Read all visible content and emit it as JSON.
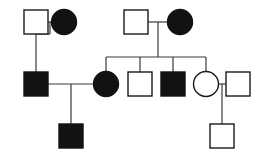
{
  "figure": {
    "kind": "pedigree-chart",
    "title": "",
    "background_color": "#ffffff",
    "stroke_color": "#3a3a3a",
    "symbol_outline_color": "#1a1a1a",
    "affected_fill_color": "#121212",
    "unaffected_fill_color": "#ffffff",
    "width": 260,
    "height": 157
  },
  "legend_meaning": {
    "square": "male",
    "circle": "female",
    "filled": "affected",
    "open": "unaffected"
  },
  "chart_data": {
    "type": "diagram",
    "diagram_type": "pedigree",
    "generations": 3,
    "individuals": [
      {
        "id": "I-1",
        "generation": 1,
        "sex": "male",
        "shape": "square",
        "status": "unaffected",
        "filled": false,
        "x": 36,
        "y": 22,
        "size": 24
      },
      {
        "id": "I-2",
        "generation": 1,
        "sex": "female",
        "shape": "circle",
        "status": "affected",
        "filled": true,
        "x": 64,
        "y": 22,
        "size": 24
      },
      {
        "id": "I-3",
        "generation": 1,
        "sex": "male",
        "shape": "square",
        "status": "unaffected",
        "filled": false,
        "x": 136,
        "y": 22,
        "size": 24
      },
      {
        "id": "I-4",
        "generation": 1,
        "sex": "female",
        "shape": "circle",
        "status": "affected",
        "filled": true,
        "x": 180,
        "y": 22,
        "size": 24
      },
      {
        "id": "II-1",
        "generation": 2,
        "sex": "male",
        "shape": "square",
        "status": "affected",
        "filled": true,
        "x": 36,
        "y": 84,
        "size": 24
      },
      {
        "id": "II-2",
        "generation": 2,
        "sex": "female",
        "shape": "circle",
        "status": "affected",
        "filled": true,
        "x": 106,
        "y": 84,
        "size": 24
      },
      {
        "id": "II-3",
        "generation": 2,
        "sex": "male",
        "shape": "square",
        "status": "unaffected",
        "filled": false,
        "x": 140,
        "y": 84,
        "size": 24
      },
      {
        "id": "II-4",
        "generation": 2,
        "sex": "male",
        "shape": "square",
        "status": "affected",
        "filled": true,
        "x": 173,
        "y": 84,
        "size": 24
      },
      {
        "id": "II-5",
        "generation": 2,
        "sex": "female",
        "shape": "circle",
        "status": "unaffected",
        "filled": false,
        "x": 206,
        "y": 84,
        "size": 24
      },
      {
        "id": "II-6",
        "generation": 2,
        "sex": "male",
        "shape": "square",
        "status": "unaffected",
        "filled": false,
        "x": 238,
        "y": 84,
        "size": 24
      },
      {
        "id": "III-1",
        "generation": 3,
        "sex": "male",
        "shape": "square",
        "status": "affected",
        "filled": true,
        "x": 71,
        "y": 136,
        "size": 24
      },
      {
        "id": "III-2",
        "generation": 3,
        "sex": "male",
        "shape": "square",
        "status": "unaffected",
        "filled": false,
        "x": 222,
        "y": 136,
        "size": 24
      }
    ],
    "matings": [
      {
        "id": "M1",
        "partners": [
          "I-1",
          "I-2"
        ],
        "children": [
          "II-1"
        ]
      },
      {
        "id": "M2",
        "partners": [
          "I-3",
          "I-4"
        ],
        "children": [
          "II-2",
          "II-3",
          "II-4",
          "II-5"
        ]
      },
      {
        "id": "M3",
        "partners": [
          "II-1",
          "II-2"
        ],
        "children": [
          "III-1"
        ]
      },
      {
        "id": "M4",
        "partners": [
          "II-5",
          "II-6"
        ],
        "children": [
          "III-2"
        ]
      }
    ],
    "counts": {
      "total_individuals": 12,
      "affected": 6,
      "unaffected": 6,
      "males": 8,
      "females": 4,
      "matings": 4
    }
  }
}
